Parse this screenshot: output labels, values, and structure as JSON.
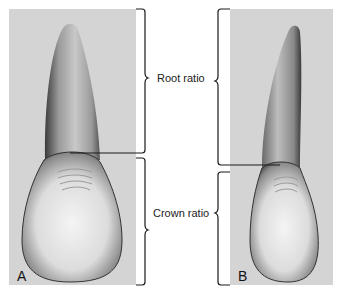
{
  "figure": {
    "panels": [
      {
        "id": "A",
        "label": "A"
      },
      {
        "id": "B",
        "label": "B"
      }
    ],
    "labels": {
      "root": "Root ratio",
      "crown": "Crown ratio"
    },
    "colors": {
      "background": "#ffffff",
      "panel": "#d4d4d4",
      "bracket": "#1a1a1a"
    }
  }
}
